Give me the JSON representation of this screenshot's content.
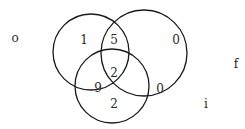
{
  "diagram": {
    "type": "venn",
    "sets": [
      {
        "id": "o",
        "label": "o",
        "label_pos": [
          15,
          38
        ],
        "circle": {
          "cx": 91,
          "cy": 52,
          "r": 38
        }
      },
      {
        "id": "f",
        "label": "f",
        "label_pos": [
          236,
          64
        ],
        "circle": {
          "cx": 144,
          "cy": 53,
          "r": 43
        }
      },
      {
        "id": "i",
        "label": "i",
        "label_pos": [
          206,
          104
        ],
        "circle": {
          "cx": 112,
          "cy": 86,
          "r": 37
        }
      }
    ],
    "regions": [
      {
        "sets": [
          "o"
        ],
        "value": "1",
        "pos": [
          84,
          40
        ]
      },
      {
        "sets": [
          "o",
          "f"
        ],
        "value": "5",
        "pos": [
          114,
          40
        ]
      },
      {
        "sets": [
          "f"
        ],
        "value": "0",
        "pos": [
          176,
          40
        ]
      },
      {
        "sets": [
          "o",
          "f",
          "i"
        ],
        "value": "2",
        "pos": [
          114,
          73
        ]
      },
      {
        "sets": [
          "o",
          "i"
        ],
        "value": "9",
        "pos": [
          98,
          88
        ]
      },
      {
        "sets": [
          "f",
          "i"
        ],
        "value": "0",
        "pos": [
          160,
          89
        ]
      },
      {
        "sets": [
          "i"
        ],
        "value": "2",
        "pos": [
          114,
          104
        ]
      }
    ]
  }
}
